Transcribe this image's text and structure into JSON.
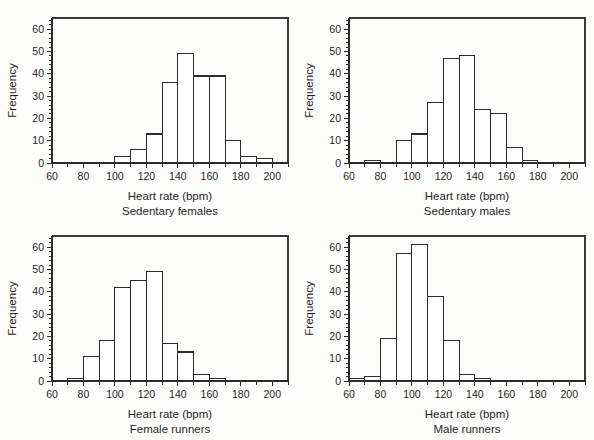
{
  "figure": {
    "title": "",
    "background": "#fdfdfc",
    "ink": "#2b2b2b"
  },
  "chart_data": [
    {
      "type": "bar",
      "title": "",
      "subtitle": "Sedentary females",
      "xlabel": "Heart rate (bpm)",
      "ylabel": "Frequency",
      "xlim": [
        60,
        210
      ],
      "ylim": [
        0,
        65
      ],
      "xticks": [
        60,
        70,
        80,
        90,
        100,
        110,
        120,
        130,
        140,
        150,
        160,
        170,
        180,
        190,
        200,
        210
      ],
      "xticklabels": [
        "60",
        "",
        "80",
        "",
        "100",
        "",
        "120",
        "",
        "140",
        "",
        "160",
        "",
        "180",
        "",
        "200",
        ""
      ],
      "yticks": [
        0,
        10,
        20,
        30,
        40,
        50,
        60
      ],
      "yticklabels": [
        "0",
        "10",
        "20",
        "30",
        "40",
        "50",
        "60"
      ],
      "grid": false,
      "legend": "none",
      "bin_width": 10,
      "bin_edges": [
        100,
        110,
        120,
        130,
        140,
        150,
        160,
        170,
        180,
        190,
        200
      ],
      "categories": [
        "100-110",
        "110-120",
        "120-130",
        "130-140",
        "140-150",
        "150-160",
        "160-170",
        "170-180",
        "180-190",
        "190-200"
      ],
      "values": [
        3,
        6,
        13,
        36,
        49,
        39,
        39,
        10,
        3,
        2
      ]
    },
    {
      "type": "bar",
      "title": "",
      "subtitle": "Sedentary males",
      "xlabel": "Heart rate (bpm)",
      "ylabel": "Frequency",
      "xlim": [
        60,
        210
      ],
      "ylim": [
        0,
        65
      ],
      "xticks": [
        60,
        70,
        80,
        90,
        100,
        110,
        120,
        130,
        140,
        150,
        160,
        170,
        180,
        190,
        200,
        210
      ],
      "xticklabels": [
        "60",
        "",
        "80",
        "",
        "100",
        "",
        "120",
        "",
        "140",
        "",
        "160",
        "",
        "180",
        "",
        "200",
        ""
      ],
      "yticks": [
        0,
        10,
        20,
        30,
        40,
        50,
        60
      ],
      "yticklabels": [
        "0",
        "10",
        "20",
        "30",
        "40",
        "50",
        "60"
      ],
      "grid": false,
      "legend": "none",
      "bin_width": 10,
      "bin_edges": [
        70,
        80,
        90,
        100,
        110,
        120,
        130,
        140,
        150,
        160,
        170,
        180
      ],
      "categories": [
        "70-80",
        "80-90",
        "90-100",
        "100-110",
        "110-120",
        "120-130",
        "130-140",
        "140-150",
        "150-160",
        "160-170",
        "170-180"
      ],
      "values": [
        1,
        0,
        10,
        13,
        27,
        47,
        48,
        24,
        22,
        7,
        1
      ]
    },
    {
      "type": "bar",
      "title": "",
      "subtitle": "Female runners",
      "xlabel": "Heart rate (bpm)",
      "ylabel": "Frequency",
      "xlim": [
        60,
        210
      ],
      "ylim": [
        0,
        65
      ],
      "xticks": [
        60,
        70,
        80,
        90,
        100,
        110,
        120,
        130,
        140,
        150,
        160,
        170,
        180,
        190,
        200,
        210
      ],
      "xticklabels": [
        "60",
        "",
        "80",
        "",
        "100",
        "",
        "120",
        "",
        "140",
        "",
        "160",
        "",
        "180",
        "",
        "200",
        ""
      ],
      "yticks": [
        0,
        10,
        20,
        30,
        40,
        50,
        60
      ],
      "yticklabels": [
        "0",
        "10",
        "20",
        "30",
        "40",
        "50",
        "60"
      ],
      "grid": false,
      "legend": "none",
      "bin_width": 10,
      "bin_edges": [
        70,
        80,
        90,
        100,
        110,
        120,
        130,
        140,
        150,
        160,
        170
      ],
      "categories": [
        "70-80",
        "80-90",
        "90-100",
        "100-110",
        "110-120",
        "120-130",
        "130-140",
        "140-150",
        "150-160",
        "160-170"
      ],
      "values": [
        1,
        11,
        18,
        42,
        45,
        49,
        17,
        13,
        3,
        1
      ]
    },
    {
      "type": "bar",
      "title": "",
      "subtitle": "Male runners",
      "xlabel": "Heart rate (bpm)",
      "ylabel": "Frequency",
      "xlim": [
        60,
        210
      ],
      "ylim": [
        0,
        65
      ],
      "xticks": [
        60,
        70,
        80,
        90,
        100,
        110,
        120,
        130,
        140,
        150,
        160,
        170,
        180,
        190,
        200,
        210
      ],
      "xticklabels": [
        "60",
        "",
        "80",
        "",
        "100",
        "",
        "120",
        "",
        "140",
        "",
        "160",
        "",
        "180",
        "",
        "200",
        ""
      ],
      "yticks": [
        0,
        10,
        20,
        30,
        40,
        50,
        60
      ],
      "yticklabels": [
        "0",
        "10",
        "20",
        "30",
        "40",
        "50",
        "60"
      ],
      "grid": false,
      "legend": "none",
      "bin_width": 10,
      "bin_edges": [
        60,
        70,
        80,
        90,
        100,
        110,
        120,
        130,
        140,
        150
      ],
      "categories": [
        "60-70",
        "70-80",
        "80-90",
        "90-100",
        "100-110",
        "110-120",
        "120-130",
        "130-140",
        "140-150"
      ],
      "values": [
        1,
        2,
        19,
        57,
        61,
        38,
        18,
        3,
        1
      ]
    }
  ]
}
